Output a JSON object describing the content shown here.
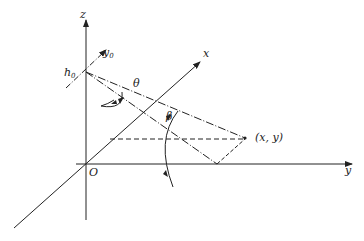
{
  "diagram": {
    "type": "3d-coordinate-geometry",
    "axes": {
      "z_label": "z",
      "x_label": "x",
      "y_label": "y",
      "origin_label": "O"
    },
    "labels": {
      "h0_main": "h",
      "h0_sub": "0",
      "y0_main": "y",
      "y0_sub": "0",
      "theta": "θ",
      "beta": "β",
      "point": "(x, y)"
    },
    "colors": {
      "line": "#222222",
      "background": "#ffffff"
    }
  }
}
